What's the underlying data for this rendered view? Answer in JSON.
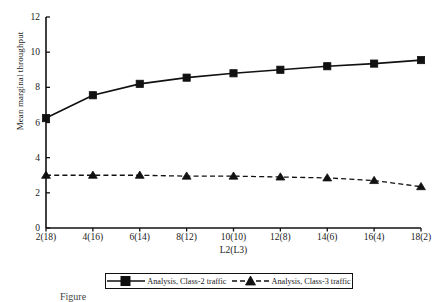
{
  "chart_data": {
    "type": "line",
    "title": "",
    "xlabel": "L2(L3)",
    "ylabel": "Mean marginal throughput",
    "categories": [
      "2(18)",
      "4(16)",
      "6(14)",
      "8(12)",
      "10(10)",
      "12(8)",
      "14(6)",
      "16(4)",
      "18(2)"
    ],
    "ylim": [
      0,
      12
    ],
    "yticks": [
      0,
      2,
      4,
      6,
      8,
      10,
      12
    ],
    "grid": false,
    "legend_position": "below-axis",
    "series": [
      {
        "name": "Analysis, Class-2 traffic",
        "marker": "square",
        "line_style": "solid",
        "color": "#111111",
        "values": [
          6.25,
          7.55,
          8.2,
          8.55,
          8.8,
          9.0,
          9.2,
          9.35,
          9.55
        ]
      },
      {
        "name": "Analysis, Class-3 traffic",
        "marker": "triangle",
        "line_style": "dashed",
        "color": "#111111",
        "values": [
          3.0,
          3.0,
          3.0,
          2.95,
          2.95,
          2.9,
          2.85,
          2.7,
          2.35
        ]
      }
    ]
  },
  "legend": {
    "entries": [
      {
        "label": "Analysis, Class-2 traffic"
      },
      {
        "label": "Analysis, Class-3 traffic"
      }
    ]
  },
  "caption": {
    "text": "Figure"
  }
}
